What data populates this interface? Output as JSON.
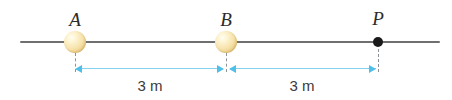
{
  "diagram": {
    "axis": {
      "name": "horizontal-reference-line",
      "color": "#6f6f6f",
      "x_start": 20,
      "x_end": 440,
      "y": 42
    },
    "points": [
      {
        "id": "A",
        "label": "A",
        "type": "sphere",
        "x": 75,
        "y": 42,
        "radius": 10.5,
        "color": "#f2dfa8"
      },
      {
        "id": "B",
        "label": "B",
        "type": "sphere",
        "x": 226,
        "y": 42,
        "radius": 10.5,
        "color": "#f2dfa8"
      },
      {
        "id": "P",
        "label": "P",
        "type": "dot",
        "x": 378,
        "y": 42,
        "radius": 4.5,
        "color": "#1a1a1a"
      }
    ],
    "dimensions": [
      {
        "id": "dim-A-B",
        "label": "3 m",
        "from": "A",
        "to": "B",
        "x_start": 75,
        "x_end": 226,
        "y": 68,
        "text_x": 150,
        "text_y": 78,
        "color": "#4fbfe8"
      },
      {
        "id": "dim-B-P",
        "label": "3 m",
        "from": "B",
        "to": "P",
        "x_start": 226,
        "x_end": 378,
        "y": 68,
        "text_x": 302,
        "text_y": 78,
        "color": "#4fbfe8"
      }
    ],
    "extension_lines": [
      {
        "id": "ext-A",
        "x": 75,
        "y_top": 53,
        "y_bottom": 72
      },
      {
        "id": "ext-B",
        "x": 226,
        "y_top": 53,
        "y_bottom": 72
      },
      {
        "id": "ext-P",
        "x": 378,
        "y_top": 49,
        "y_bottom": 72
      }
    ]
  }
}
